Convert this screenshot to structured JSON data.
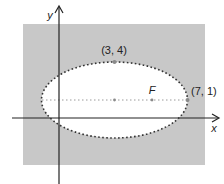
{
  "diagram": {
    "colors": {
      "background_region": "#c8c8c8",
      "ellipse_fill": "#ffffff",
      "axis": "#222222",
      "ellipse_outline": "#333333",
      "major_axis_line": "#9a9a9a",
      "point": "#8a8a8a"
    },
    "axes": {
      "x_label": "x",
      "y_label": "y"
    },
    "points": [
      {
        "name": "co-vertex",
        "label": "(3, 4)"
      },
      {
        "name": "focus",
        "label": "F"
      },
      {
        "name": "vertex",
        "label": "(7, 1)"
      },
      {
        "name": "center",
        "label": ""
      }
    ],
    "ellipse": {
      "center": [
        3,
        1
      ],
      "semi_major": 4,
      "semi_minor": 3,
      "outline_style": "dotted"
    }
  }
}
